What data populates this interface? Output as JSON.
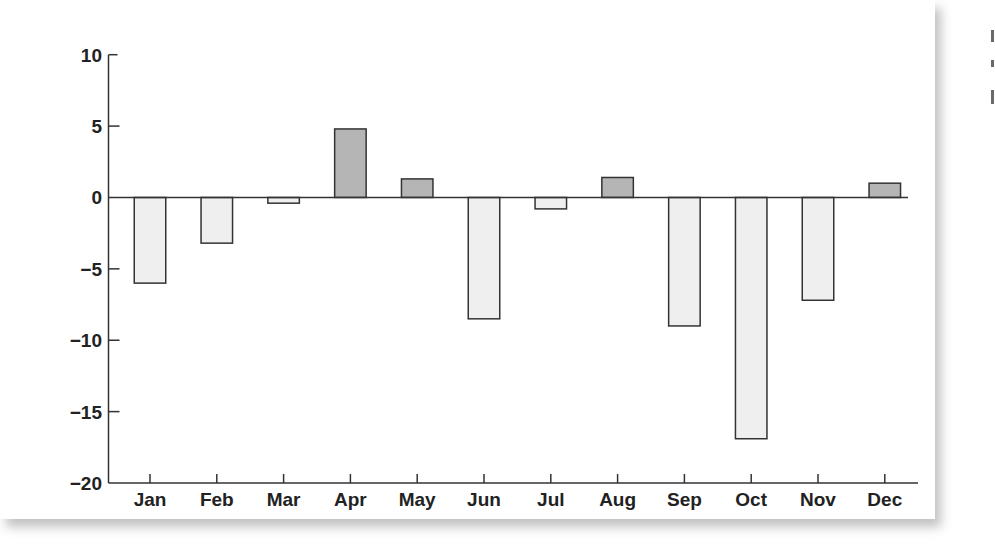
{
  "chart_data": {
    "type": "bar",
    "title": "",
    "xlabel": "",
    "ylabel": "",
    "categories": [
      "Jan",
      "Feb",
      "Mar",
      "Apr",
      "May",
      "Jun",
      "Jul",
      "Aug",
      "Sep",
      "Oct",
      "Nov",
      "Dec"
    ],
    "values": [
      -6.0,
      -3.2,
      -0.4,
      4.8,
      1.3,
      -8.5,
      -0.8,
      1.4,
      -9.0,
      -16.9,
      -7.2,
      1.0
    ],
    "ylim": [
      -20,
      10
    ],
    "yticks": [
      10,
      5,
      0,
      -5,
      -10,
      -15,
      -20
    ],
    "ytick_labels": [
      "10",
      "5",
      "0",
      "−5",
      "−10",
      "−15",
      "−20"
    ],
    "grid": false,
    "legend": null,
    "colors": {
      "positive_fill": "#b5b5b5",
      "negative_fill": "#efefef",
      "bar_stroke": "#333333",
      "axis": "#333333",
      "text": "#222222"
    }
  }
}
